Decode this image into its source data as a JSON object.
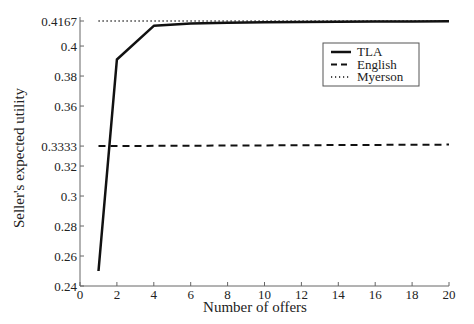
{
  "chart_data": {
    "type": "line",
    "title": "",
    "xlabel": "Number of offers",
    "ylabel": "Seller's expected utility",
    "xlim": [
      0,
      20
    ],
    "ylim": [
      0.24,
      0.4167
    ],
    "grid": false,
    "legend_position": "upper right (inset)",
    "xticks": [
      0,
      2,
      4,
      6,
      8,
      10,
      12,
      14,
      16,
      18,
      20
    ],
    "yticks": [
      0.24,
      0.26,
      0.28,
      0.3,
      0.32,
      0.3333,
      0.36,
      0.38,
      0.4,
      0.4167
    ],
    "ytick_labels": [
      "0.24",
      "0.26",
      "0.28",
      "0.3",
      "0.32",
      "0.3333",
      "0.36",
      "0.38",
      "0.4",
      "0.4167"
    ],
    "series": [
      {
        "name": "TLA",
        "style": "solid",
        "x": [
          1,
          2,
          4,
          6,
          8,
          10,
          12,
          14,
          16,
          18,
          20
        ],
        "values": [
          0.25,
          0.391,
          0.4135,
          0.415,
          0.4155,
          0.4158,
          0.416,
          0.4162,
          0.4163,
          0.4164,
          0.4165
        ]
      },
      {
        "name": "English",
        "style": "dashed",
        "x": [
          1,
          20
        ],
        "values": [
          0.3333,
          0.3343
        ]
      },
      {
        "name": "Myerson",
        "style": "dotted",
        "x": [
          1,
          20
        ],
        "values": [
          0.4167,
          0.4167
        ]
      }
    ]
  },
  "legend": {
    "items": [
      {
        "label": "TLA",
        "style": "solid"
      },
      {
        "label": "English",
        "style": "dashed"
      },
      {
        "label": "Myerson",
        "style": "dotted"
      }
    ]
  }
}
